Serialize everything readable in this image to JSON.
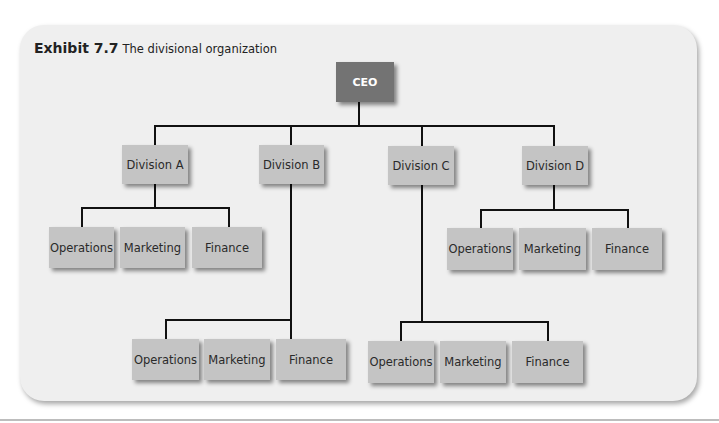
{
  "exhibit": {
    "number": "Exhibit 7.7",
    "title": "The divisional organization"
  },
  "chart": {
    "root": {
      "label": "CEO",
      "color": "#737373"
    },
    "divisions": [
      {
        "label": "Division A",
        "children": [
          "Operations",
          "Marketing",
          "Finance"
        ]
      },
      {
        "label": "Division B",
        "children": [
          "Operations",
          "Marketing",
          "Finance"
        ]
      },
      {
        "label": "Division C",
        "children": [
          "Operations",
          "Marketing",
          "Finance"
        ]
      },
      {
        "label": "Division D",
        "children": [
          "Operations",
          "Marketing",
          "Finance"
        ]
      }
    ],
    "box_color": "#c4c4c4",
    "background_color": "#efefef"
  }
}
